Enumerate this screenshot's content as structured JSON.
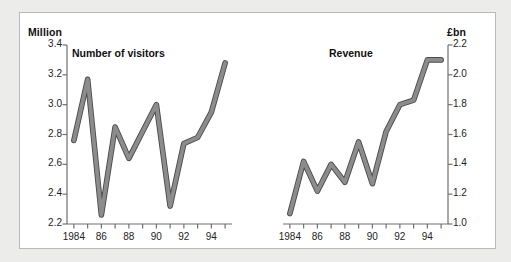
{
  "figure": {
    "background_color": "#ececeb",
    "panel_color": "#ffffff",
    "border_color": "#b9b9b9",
    "line_color": "#8c8c8c",
    "line_outline_color": "#4a4a4a",
    "axis_color": "#707070",
    "text_color": "#101010"
  },
  "chart_data": [
    {
      "type": "line",
      "title": "Number of visitors",
      "ylabel": "Million",
      "xlabel": "",
      "unit_label": "Million",
      "axis_side": "left",
      "grid": false,
      "legend": "none",
      "x": [
        1984,
        1985,
        1986,
        1987,
        1988,
        1989,
        1990,
        1991,
        1992,
        1993,
        1994,
        1995
      ],
      "values": [
        2.76,
        3.17,
        2.26,
        2.85,
        2.64,
        2.82,
        3.0,
        2.32,
        2.74,
        2.78,
        2.95,
        3.28
      ],
      "ylim": [
        2.2,
        3.4
      ],
      "yticks": [
        3.4,
        3.2,
        3.0,
        2.8,
        2.6,
        2.4,
        2.2
      ],
      "ytick_labels": [
        "3.4",
        "3.2",
        "3.0",
        "2.8",
        "2.6",
        "2.4",
        "2.2"
      ],
      "xticks": [
        1984,
        1985,
        1986,
        1987,
        1988,
        1989,
        1990,
        1991,
        1992,
        1993,
        1994,
        1995
      ],
      "xtick_labels": [
        "1984",
        "",
        "86",
        "",
        "88",
        "",
        "90",
        "",
        "92",
        "",
        "94",
        ""
      ],
      "xlim": [
        1983.5,
        1995.5
      ]
    },
    {
      "type": "line",
      "title": "Revenue",
      "ylabel": "£bn",
      "xlabel": "",
      "unit_label": "£bn",
      "axis_side": "right",
      "grid": false,
      "legend": "none",
      "x": [
        1984,
        1985,
        1986,
        1987,
        1988,
        1989,
        1990,
        1991,
        1992,
        1993,
        1994,
        1995
      ],
      "values": [
        1.07,
        1.42,
        1.22,
        1.4,
        1.28,
        1.55,
        1.27,
        1.62,
        1.8,
        1.83,
        2.1,
        2.1
      ],
      "ylim": [
        1.0,
        2.2
      ],
      "yticks": [
        2.2,
        2.0,
        1.8,
        1.6,
        1.4,
        1.2,
        1.0
      ],
      "ytick_labels": [
        "2.2",
        "2.0",
        "1.8",
        "1.6",
        "1.4",
        "1.2",
        "1.0"
      ],
      "xticks": [
        1984,
        1985,
        1986,
        1987,
        1988,
        1989,
        1990,
        1991,
        1992,
        1993,
        1994,
        1995
      ],
      "xtick_labels": [
        "1984",
        "",
        "86",
        "",
        "88",
        "",
        "90",
        "",
        "92",
        "",
        "94",
        ""
      ],
      "xlim": [
        1983.5,
        1995.5
      ]
    }
  ]
}
